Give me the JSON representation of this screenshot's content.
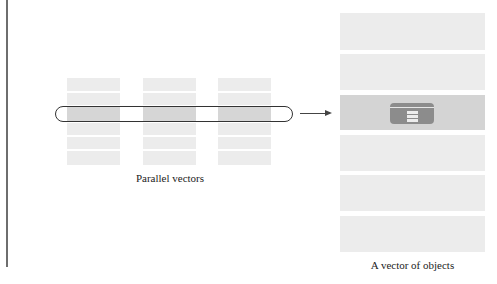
{
  "diagram": {
    "left_group": {
      "label": "Parallel vectors",
      "columns": [
        {
          "id": "vector-1",
          "x": 67,
          "rows": 6,
          "highlighted_row": 2
        },
        {
          "id": "vector-2",
          "x": 143,
          "rows": 6,
          "highlighted_row": 2
        },
        {
          "id": "vector-3",
          "x": 218,
          "rows": 6,
          "highlighted_row": 2
        }
      ],
      "selection": "pill outline spanning row 3 across all vectors"
    },
    "arrow": {
      "direction": "right"
    },
    "right_group": {
      "label": "A vector of objects",
      "rows": 6,
      "highlighted_row": 2,
      "highlight_icon": "object-record-icon"
    },
    "colors": {
      "cell": "#ececec",
      "cell_highlight": "#d6d6d6",
      "icon": "#8c8c8c",
      "outline": "#333333"
    }
  }
}
